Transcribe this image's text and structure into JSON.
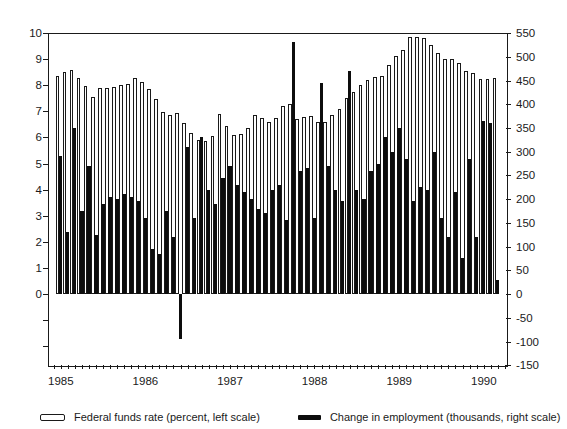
{
  "chart_data": {
    "type": "bar",
    "title": "",
    "categories": [
      "1985-01",
      "1985-02",
      "1985-03",
      "1985-04",
      "1985-05",
      "1985-06",
      "1985-07",
      "1985-08",
      "1985-09",
      "1985-10",
      "1985-11",
      "1985-12",
      "1986-01",
      "1986-02",
      "1986-03",
      "1986-04",
      "1986-05",
      "1986-06",
      "1986-07",
      "1986-08",
      "1986-09",
      "1986-10",
      "1986-11",
      "1986-12",
      "1987-01",
      "1987-02",
      "1987-03",
      "1987-04",
      "1987-05",
      "1987-06",
      "1987-07",
      "1987-08",
      "1987-09",
      "1987-10",
      "1987-11",
      "1987-12",
      "1988-01",
      "1988-02",
      "1988-03",
      "1988-04",
      "1988-05",
      "1988-06",
      "1988-07",
      "1988-08",
      "1988-09",
      "1988-10",
      "1988-11",
      "1988-12",
      "1989-01",
      "1989-02",
      "1989-03",
      "1989-04",
      "1989-05",
      "1989-06",
      "1989-07",
      "1989-08",
      "1989-09",
      "1989-10",
      "1989-11",
      "1989-12",
      "1990-01",
      "1990-02",
      "1990-03"
    ],
    "series": [
      {
        "name": "Federal funds rate (percent, left scale)",
        "axis": "left",
        "color": "#ffffff",
        "values": [
          8.35,
          8.5,
          8.58,
          8.27,
          7.97,
          7.53,
          7.88,
          7.9,
          7.92,
          7.99,
          8.05,
          8.27,
          8.14,
          7.86,
          7.48,
          6.99,
          6.85,
          6.92,
          6.56,
          6.17,
          5.89,
          5.85,
          6.04,
          6.91,
          6.43,
          6.1,
          6.13,
          6.37,
          6.85,
          6.73,
          6.58,
          6.73,
          7.22,
          7.29,
          6.69,
          6.77,
          6.83,
          6.58,
          6.58,
          6.87,
          7.09,
          7.51,
          7.75,
          8.01,
          8.19,
          8.3,
          8.35,
          8.76,
          9.12,
          9.36,
          9.85,
          9.84,
          9.81,
          9.53,
          9.24,
          8.99,
          9.02,
          8.84,
          8.55,
          8.45,
          8.23,
          8.24,
          8.28
        ]
      },
      {
        "name": "Change in employment (thousands, right scale)",
        "axis": "right",
        "color": "#0d0d0d",
        "values": [
          290,
          130,
          350,
          175,
          270,
          125,
          190,
          205,
          200,
          210,
          205,
          195,
          160,
          95,
          85,
          175,
          120,
          -95,
          310,
          160,
          330,
          220,
          190,
          245,
          270,
          230,
          215,
          200,
          180,
          170,
          220,
          230,
          155,
          530,
          260,
          265,
          160,
          445,
          270,
          220,
          195,
          470,
          220,
          200,
          260,
          275,
          330,
          300,
          350,
          285,
          195,
          225,
          220,
          300,
          160,
          120,
          215,
          75,
          285,
          120,
          365,
          360,
          30
        ]
      }
    ],
    "left_axis": {
      "tick_labels": [
        "10",
        "9",
        "8",
        "7",
        "6",
        "5",
        "4",
        "3",
        "2",
        "1",
        "0"
      ],
      "tick_values": [
        10,
        9,
        8,
        7,
        6,
        5,
        4,
        3,
        2,
        1,
        0
      ],
      "unlabeled_tick_values": [
        -1,
        -2
      ],
      "range": [
        -2.73,
        10
      ]
    },
    "right_axis": {
      "tick_labels": [
        "550",
        "500",
        "450",
        "400",
        "350",
        "300",
        "250",
        "200",
        "150",
        "100",
        "50",
        "0",
        "-50",
        "-100",
        "-150"
      ],
      "tick_values": [
        550,
        500,
        450,
        400,
        350,
        300,
        250,
        200,
        150,
        100,
        50,
        0,
        -50,
        -100,
        -150
      ],
      "range": [
        -150,
        550
      ],
      "scale_ratio_left_units_per_right_unit": 0.01818
    },
    "x_axis": {
      "year_labels": [
        "1985",
        "1986",
        "1987",
        "1988",
        "1989",
        "1990"
      ],
      "tick_interval": "monthly"
    },
    "legend_position": "bottom",
    "grid": false,
    "colors": {
      "foreground": "#1a1a1a",
      "background": "#ffffff",
      "bar_fill_black": "#0d0d0d",
      "bar_fill_white": "#ffffff"
    }
  }
}
